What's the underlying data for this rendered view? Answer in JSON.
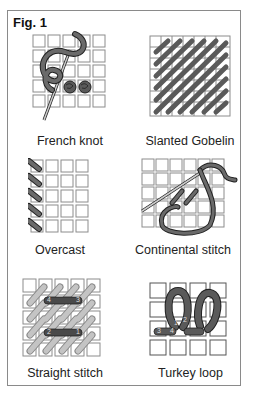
{
  "figure": {
    "title": "Fig. 1",
    "panels": [
      {
        "id": "french-knot",
        "caption": "French knot"
      },
      {
        "id": "slanted-gobelin",
        "caption": "Slanted Gobelin"
      },
      {
        "id": "overcast",
        "caption": "Overcast"
      },
      {
        "id": "continental-stitch",
        "caption": "Continental stitch"
      },
      {
        "id": "straight-stitch",
        "caption": "Straight stitch",
        "labels": [
          "4",
          "3",
          "2",
          "1"
        ]
      },
      {
        "id": "turkey-loop",
        "caption": "Turkey loop",
        "labels": [
          "1",
          "2",
          "3",
          "4"
        ]
      }
    ]
  },
  "colors": {
    "grid": "#8c8c8c",
    "thread_dark": "#5a5a5a",
    "thread_light": "#b4b4b4",
    "outline": "#222222"
  }
}
